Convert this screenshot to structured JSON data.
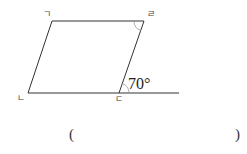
{
  "diagram": {
    "type": "parallelogram-angle-problem",
    "vertices": [
      {
        "id": "A",
        "label": "ㄱ",
        "x": 52,
        "y": 21
      },
      {
        "id": "D",
        "label": "ㄹ",
        "x": 144,
        "y": 21
      },
      {
        "id": "B",
        "label": "ㄴ",
        "x": 28,
        "y": 93
      },
      {
        "id": "C",
        "label": "ㄷ",
        "x": 119,
        "y": 93
      }
    ],
    "extension_end": {
      "x": 179,
      "y": 93
    },
    "given_angle": {
      "value": "70°",
      "at": "ㄷ",
      "between": "extension line and side ㄷㄹ"
    },
    "marked_angle": {
      "at": "ㄹ",
      "note": "unknown angle to find"
    },
    "line_color": "#333333"
  },
  "answer": {
    "open_paren": "(",
    "close_paren": ")",
    "value": ""
  }
}
